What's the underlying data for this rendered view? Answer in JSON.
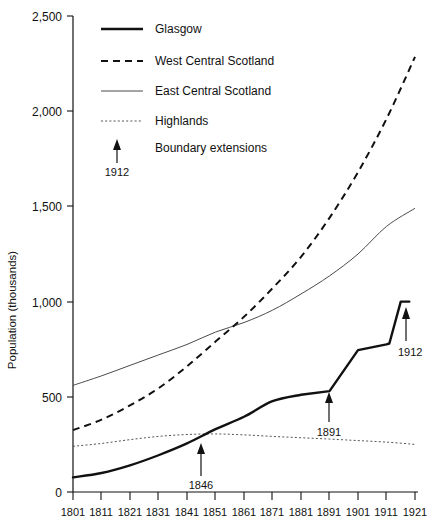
{
  "chart_data": {
    "type": "line",
    "title": "",
    "xlabel": "",
    "ylabel": "Population (thousands)",
    "xlim": [
      1801,
      1921
    ],
    "ylim": [
      0,
      2500
    ],
    "grid": false,
    "legend_position": "top-left-inside",
    "x_ticks": [
      "1801",
      "1811",
      "1821",
      "1831",
      "1841",
      "1851",
      "1861",
      "1871",
      "1881",
      "1891",
      "1901",
      "1911",
      "1921"
    ],
    "y_ticks": [
      "0",
      "500",
      "1,000",
      "1,500",
      "2,000",
      "2,500"
    ],
    "x": [
      1801,
      1811,
      1821,
      1831,
      1841,
      1851,
      1861,
      1871,
      1881,
      1891,
      1901,
      1911,
      1921
    ],
    "series": [
      {
        "name": "Glasgow",
        "style": "solid-thick",
        "values": [
          77,
          100,
          140,
          193,
          255,
          330,
          395,
          477,
          511,
          530,
          745,
          775,
          1000
        ]
      },
      {
        "name": "West Central Scotland",
        "style": "dashed",
        "values": [
          325,
          380,
          455,
          545,
          660,
          790,
          920,
          1070,
          1235,
          1440,
          1680,
          1960,
          2285
        ]
      },
      {
        "name": "East Central Scotland",
        "style": "thin-solid",
        "values": [
          560,
          610,
          665,
          720,
          775,
          840,
          890,
          955,
          1040,
          1135,
          1250,
          1395,
          1490
        ]
      },
      {
        "name": "Highlands",
        "style": "dotted",
        "values": [
          240,
          255,
          275,
          292,
          302,
          305,
          300,
          292,
          285,
          278,
          270,
          262,
          250
        ]
      }
    ],
    "annotations": [
      {
        "label": "1846",
        "year": 1846,
        "value": 300,
        "note": "Boundary extensions",
        "direction": "up"
      },
      {
        "label": "1891",
        "year": 1891,
        "value": 530,
        "note": "Boundary extensions",
        "direction": "up"
      },
      {
        "label": "1912",
        "year": 1912,
        "value": 1000,
        "note": "Boundary extensions",
        "direction": "up"
      }
    ],
    "legend_entries": [
      {
        "label": "Glasgow",
        "style": "solid-thick"
      },
      {
        "label": "West Central Scotland",
        "style": "dashed"
      },
      {
        "label": "East Central Scotland",
        "style": "thin-solid"
      },
      {
        "label": "Highlands",
        "style": "dotted"
      },
      {
        "label": "Boundary extensions",
        "style": "arrow",
        "sub_label": "1912"
      }
    ]
  }
}
